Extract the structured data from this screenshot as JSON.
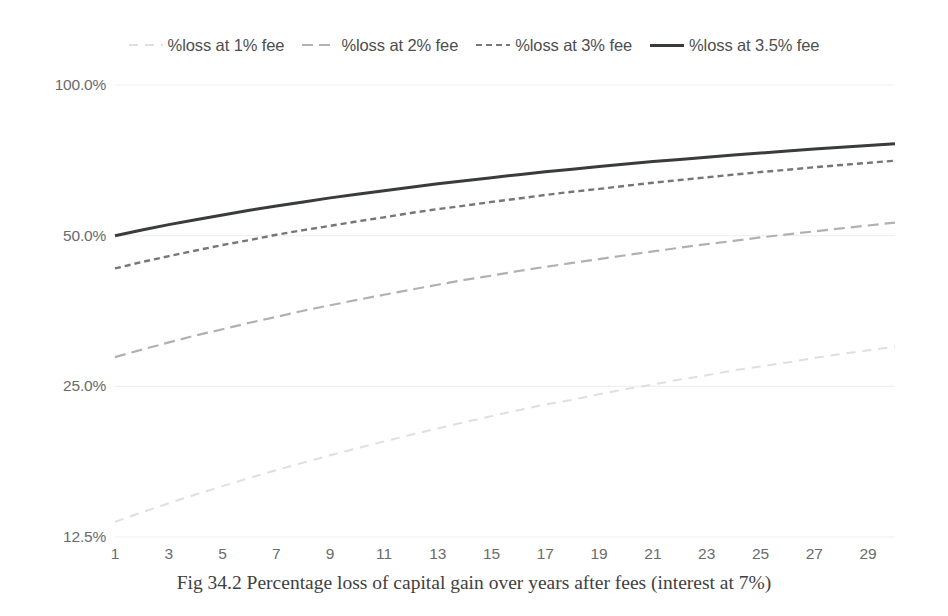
{
  "caption": "Fig 34.2 Percentage loss of capital gain over years after fees (interest at 7%)",
  "legend": [
    {
      "label": "%loss at 1% fee",
      "style": "dotted-light",
      "color": "#d8d9db"
    },
    {
      "label": "%loss at 2% fee",
      "style": "long-dash",
      "color": "#a8a9ab"
    },
    {
      "label": "%loss at 3% fee",
      "style": "short-dash",
      "color": "#6e6f71"
    },
    {
      "label": "%loss at 3.5% fee",
      "style": "solid",
      "color": "#3a3b3d"
    }
  ],
  "chart_data": {
    "type": "line",
    "title": "",
    "caption": "Fig 34.2 Percentage loss of capital gain over years after fees (interest at 7%)",
    "xlabel": "",
    "ylabel": "",
    "yscale": "log",
    "ylim": [
      12.5,
      100.0
    ],
    "xlim": [
      1,
      30
    ],
    "grid": true,
    "legend_position": "top",
    "ytick_labels": [
      "100.0%",
      "50.0%",
      "25.0%",
      "12.5%"
    ],
    "ytick_values": [
      100.0,
      50.0,
      25.0,
      12.5
    ],
    "xtick_labels": [
      "1",
      "3",
      "5",
      "7",
      "9",
      "11",
      "13",
      "15",
      "17",
      "19",
      "21",
      "23",
      "25",
      "27",
      "29"
    ],
    "xtick_values": [
      1,
      3,
      5,
      7,
      9,
      11,
      13,
      15,
      17,
      19,
      21,
      23,
      25,
      27,
      29
    ],
    "x": [
      1,
      2,
      3,
      4,
      5,
      6,
      7,
      8,
      9,
      10,
      11,
      12,
      13,
      14,
      15,
      16,
      17,
      18,
      19,
      20,
      21,
      22,
      23,
      24,
      25,
      26,
      27,
      28,
      29,
      30
    ],
    "series": [
      {
        "name": "%loss at 1% fee",
        "color": "#d8d9db",
        "dash": "dotted-light",
        "values": [
          13.4,
          14.0,
          14.6,
          15.2,
          15.8,
          16.4,
          17.0,
          17.6,
          18.2,
          18.8,
          19.4,
          20.0,
          20.6,
          21.2,
          21.8,
          22.4,
          23.0,
          23.5,
          24.1,
          24.7,
          25.2,
          25.8,
          26.3,
          26.9,
          27.4,
          27.9,
          28.5,
          29.0,
          29.5,
          30.0
        ]
      },
      {
        "name": "%loss at 2% fee",
        "color": "#a8a9ab",
        "dash": "long-dash",
        "values": [
          28.6,
          29.6,
          30.6,
          31.6,
          32.5,
          33.5,
          34.4,
          35.4,
          36.3,
          37.2,
          38.1,
          39.0,
          39.9,
          40.8,
          41.6,
          42.5,
          43.3,
          44.1,
          44.9,
          45.7,
          46.5,
          47.3,
          48.1,
          48.8,
          49.6,
          50.3,
          51.0,
          51.7,
          52.4,
          53.1
        ]
      },
      {
        "name": "%loss at 3% fee",
        "color": "#6e6f71",
        "dash": "short-dash",
        "values": [
          43.0,
          44.3,
          45.5,
          46.7,
          47.9,
          49.0,
          50.2,
          51.3,
          52.3,
          53.4,
          54.4,
          55.5,
          56.5,
          57.4,
          58.4,
          59.3,
          60.3,
          61.2,
          62.0,
          62.9,
          63.8,
          64.6,
          65.4,
          66.2,
          67.0,
          67.7,
          68.5,
          69.2,
          69.9,
          70.6
        ]
      },
      {
        "name": "%loss at 3.5% fee",
        "color": "#3a3b3d",
        "dash": "solid",
        "values": [
          50.0,
          51.3,
          52.6,
          53.8,
          55.0,
          56.2,
          57.3,
          58.4,
          59.5,
          60.5,
          61.5,
          62.5,
          63.5,
          64.4,
          65.3,
          66.2,
          67.1,
          67.9,
          68.7,
          69.5,
          70.3,
          71.0,
          71.7,
          72.5,
          73.1,
          73.8,
          74.5,
          75.1,
          75.7,
          76.3
        ]
      }
    ]
  }
}
